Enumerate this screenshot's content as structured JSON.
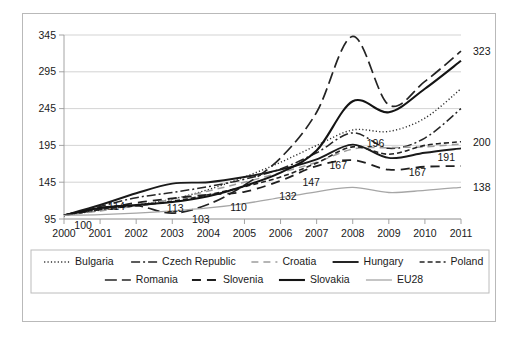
{
  "chart_data": {
    "type": "line",
    "title": "",
    "subtitle": "",
    "xlabel": "",
    "ylabel": "",
    "x": [
      2000,
      2001,
      2002,
      2003,
      2004,
      2005,
      2006,
      2007,
      2008,
      2009,
      2010,
      2011
    ],
    "xtick_labels": [
      "2000",
      "2001",
      "2002",
      "2003",
      "2004",
      "2005",
      "2006",
      "2007",
      "2008",
      "2009",
      "2010",
      "2011"
    ],
    "ytick_labels": [
      "95",
      "145",
      "195",
      "245",
      "295",
      "345"
    ],
    "yticks": [
      95,
      145,
      195,
      245,
      295,
      345
    ],
    "ylim": [
      95,
      345
    ],
    "xlim": [
      2000,
      2011
    ],
    "grid": true,
    "legend_position": "bottom",
    "series": [
      {
        "name": "Bulgaria",
        "style": "dotted",
        "color": "#303030",
        "width": 1.4,
        "dash": "1.2,2.2",
        "values": [
          100,
          107,
          114,
          122,
          135,
          152,
          172,
          195,
          216,
          214,
          232,
          272
        ]
      },
      {
        "name": "Czech Republic",
        "style": "dash-dot",
        "color": "#262626",
        "width": 1.5,
        "dash": "9,3,2,3",
        "values": [
          100,
          112,
          124,
          131,
          139,
          149,
          163,
          185,
          212,
          191,
          205,
          245
        ]
      },
      {
        "name": "Croatia",
        "style": "dashed-light",
        "color": "#9d9d9d",
        "width": 1.5,
        "dash": "7,5",
        "values": [
          100,
          106,
          113,
          122,
          133,
          145,
          158,
          172,
          190,
          192,
          193,
          197
        ]
      },
      {
        "name": "Hungary",
        "style": "solid",
        "color": "#1a1a1a",
        "width": 1.9,
        "dash": "",
        "values": [
          100,
          114,
          130,
          143,
          145,
          152,
          162,
          176,
          196,
          178,
          185,
          191
        ]
      },
      {
        "name": "Poland",
        "style": "dashed-fine",
        "color": "#232323",
        "width": 1.6,
        "dash": "5,3",
        "values": [
          100,
          108,
          113,
          119,
          128,
          139,
          152,
          171,
          193,
          183,
          195,
          200
        ]
      },
      {
        "name": "Romania",
        "style": "dashed-long",
        "color": "#242424",
        "width": 1.7,
        "dash": "12,5",
        "values": [
          100,
          110,
          113,
          103,
          115,
          141,
          178,
          240,
          343,
          250,
          282,
          323
        ]
      },
      {
        "name": "Slovenia",
        "style": "dashed-wide",
        "color": "#1f1f1f",
        "width": 1.8,
        "dash": "9,6",
        "values": [
          100,
          108,
          117,
          123,
          128,
          132,
          147,
          167,
          175,
          162,
          166,
          167
        ]
      },
      {
        "name": "Slovakia",
        "style": "solid",
        "color": "#141414",
        "width": 2.1,
        "dash": "",
        "values": [
          100,
          110,
          114,
          118,
          126,
          140,
          158,
          188,
          255,
          240,
          272,
          310
        ]
      },
      {
        "name": "EU28",
        "style": "solid-light",
        "color": "#a6a6a6",
        "width": 1.3,
        "dash": "",
        "values": [
          100,
          101,
          103,
          106,
          110,
          116,
          124,
          132,
          138,
          131,
          134,
          138
        ]
      }
    ],
    "annotations": [
      {
        "text": "100",
        "x": 2000.12,
        "y": 97,
        "dx": 6,
        "dy": 11
      },
      {
        "text": "114",
        "x": 2001.0,
        "y": 114,
        "dx": 8,
        "dy": 5
      },
      {
        "text": "113",
        "x": 2002.85,
        "y": 113,
        "dx": 0,
        "dy": 6
      },
      {
        "text": "103",
        "x": 2003.55,
        "y": 103,
        "dx": 0,
        "dy": 10
      },
      {
        "text": "110",
        "x": 2004.55,
        "y": 110,
        "dx": 2,
        "dy": 3
      },
      {
        "text": "132",
        "x": 2005.85,
        "y": 132,
        "dx": 4,
        "dy": 8
      },
      {
        "text": "147",
        "x": 2006.55,
        "y": 147,
        "dx": 2,
        "dy": 5
      },
      {
        "text": "167",
        "x": 2007.3,
        "y": 167,
        "dx": 2,
        "dy": 3
      },
      {
        "text": "196",
        "x": 2008.25,
        "y": 196,
        "dx": 5,
        "dy": 2
      },
      {
        "text": "167",
        "x": 2009.55,
        "y": 164,
        "dx": 0,
        "dy": 8
      },
      {
        "text": "191",
        "x": 2010.35,
        "y": 188,
        "dx": 0,
        "dy": 10
      },
      {
        "text": "323",
        "x": 2011.0,
        "y": 323,
        "dx": 12,
        "dy": 4
      },
      {
        "text": "200",
        "x": 2011.0,
        "y": 200,
        "dx": 12,
        "dy": 4
      },
      {
        "text": "138",
        "x": 2011.0,
        "y": 138,
        "dx": 12,
        "dy": 4
      }
    ]
  },
  "legend": {
    "rows": [
      [
        "Bulgaria",
        "Czech Republic",
        "Croatia",
        "Hungary",
        "Poland"
      ],
      [
        "Romania",
        "Slovenia",
        "Slovakia",
        "EU28"
      ]
    ]
  }
}
